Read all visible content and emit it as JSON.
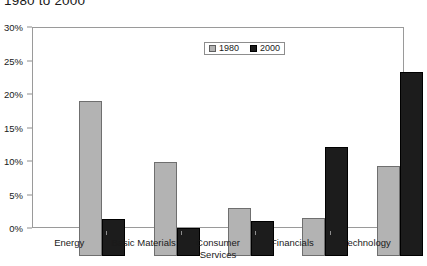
{
  "chart_data": {
    "type": "bar",
    "title": "1980 to 2000",
    "xlabel": "",
    "ylabel": "",
    "ylim": [
      0,
      30
    ],
    "ytick_labels": [
      "0%",
      "5%",
      "10%",
      "15%",
      "20%",
      "25%",
      "30%"
    ],
    "ytick_values": [
      0,
      5,
      10,
      15,
      20,
      25,
      30
    ],
    "grid": false,
    "legend_position": "top-center",
    "categories": [
      "Energy",
      "Basic Materials",
      "Consumer Services",
      "Financials",
      "Technology"
    ],
    "category_lines": [
      [
        "Energy"
      ],
      [
        "Basic Materials"
      ],
      [
        "Consumer",
        "Services"
      ],
      [
        "Financials"
      ],
      [
        "Technology"
      ]
    ],
    "series": [
      {
        "name": "1980",
        "color": "#b3b3b3",
        "values": [
          23.1,
          14.1,
          7.2,
          5.7,
          13.4
        ]
      },
      {
        "name": "2000",
        "color": "#1c1c1c",
        "values": [
          5.5,
          4.2,
          5.3,
          16.3,
          27.5
        ]
      }
    ]
  }
}
